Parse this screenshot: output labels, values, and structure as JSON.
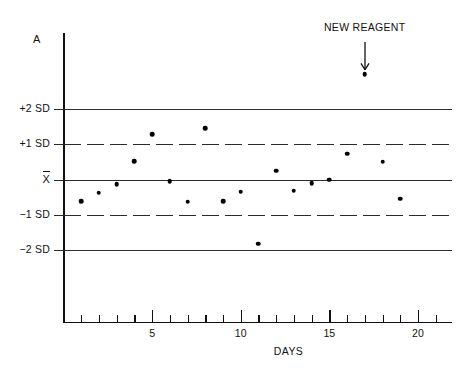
{
  "chart_data": {
    "type": "scatter",
    "title": "",
    "xlabel": "DAYS",
    "ylabel": "A",
    "xlim": [
      0,
      22
    ],
    "ylim": [
      -2.6,
      3.4
    ],
    "grid": false,
    "legend": "none",
    "x_ticks_major": [
      5,
      10,
      15,
      20
    ],
    "x_tick_labels": [
      "5",
      "10",
      "15",
      "20"
    ],
    "x_ticks_minor": [
      1,
      2,
      3,
      4,
      6,
      7,
      8,
      9,
      11,
      12,
      13,
      14,
      16,
      17,
      18,
      19,
      21
    ],
    "y_reference_lines": [
      {
        "label": "+2 SD",
        "value": 2,
        "style": "solid"
      },
      {
        "label": "+1 SD",
        "value": 1,
        "style": "dashed"
      },
      {
        "label": "X̄",
        "value": 0,
        "style": "solid"
      },
      {
        "label": "−1 SD",
        "value": -1,
        "style": "dashed"
      },
      {
        "label": "−2 SD",
        "value": -2,
        "style": "solid"
      }
    ],
    "series": [
      {
        "name": "Daily control value",
        "x": [
          1,
          2,
          3,
          4,
          5,
          6,
          7,
          8,
          9,
          10,
          11,
          12,
          13,
          14,
          15,
          16,
          17,
          18,
          19
        ],
        "values": [
          -0.62,
          -0.38,
          -0.14,
          0.52,
          1.28,
          -0.05,
          -0.63,
          1.45,
          -0.62,
          -0.34,
          -1.82,
          0.25,
          -0.32,
          -0.11,
          0.0,
          0.73,
          2.98,
          0.5,
          -0.55
        ]
      }
    ],
    "annotations": [
      {
        "text": "NEW REAGENT",
        "points_to_x": 17,
        "points_to_y": 2.98,
        "arrow": "down-arrow"
      }
    ]
  },
  "axis": {
    "y_name": "A",
    "x_name": "DAYS"
  }
}
